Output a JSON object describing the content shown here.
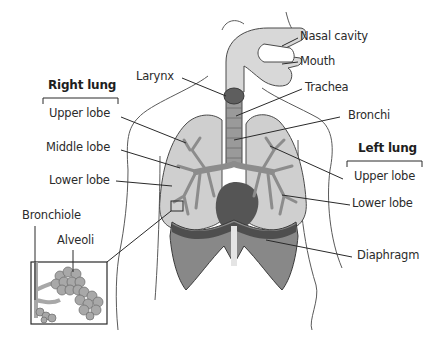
{
  "diagram": {
    "colors": {
      "lung_fill": "#cfcfcf",
      "bronchi_fill": "#8c8c8c",
      "trachea_fill": "#9a9a9a",
      "larynx_fill": "#5e5e5e",
      "airway_fill": "#d8d8d8",
      "diaphragm_fill": "#888888",
      "diaphragm_dark": "#4e4e4e",
      "heart_fill": "#555555",
      "outline": "#3a3a3a",
      "body_outline": "#5a5a5a",
      "leader_line": "#2a2a2a"
    },
    "groups": {
      "right_lung": "Right lung",
      "left_lung": "Left lung"
    },
    "labels": {
      "nasal_cavity": "Nasal cavity",
      "mouth": "Mouth",
      "larynx": "Larynx",
      "trachea": "Trachea",
      "bronchi": "Bronchi",
      "right_upper_lobe": "Upper lobe",
      "right_middle_lobe": "Middle lobe",
      "right_lower_lobe": "Lower lobe",
      "left_upper_lobe": "Upper lobe",
      "left_lower_lobe": "Lower lobe",
      "bronchiole": "Bronchiole",
      "alveoli": "Alveoli",
      "diaphragm": "Diaphragm"
    }
  }
}
